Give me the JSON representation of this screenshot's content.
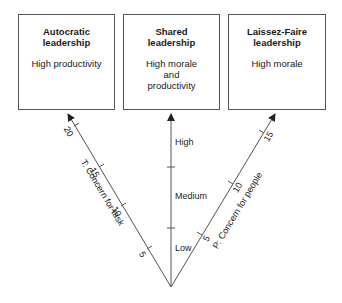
{
  "boxes": [
    {
      "title_line1": "Autocratic",
      "title_line2": "leadership",
      "desc_line1": "High productivity",
      "desc_line2": "",
      "desc_line3": ""
    },
    {
      "title_line1": "Shared",
      "title_line2": "leadership",
      "desc_line1": "High morale",
      "desc_line2": "and",
      "desc_line3": "productivity"
    },
    {
      "title_line1": "Laissez-Faire",
      "title_line2": "leadership",
      "desc_line1": "High morale",
      "desc_line2": "",
      "desc_line3": ""
    }
  ],
  "axes": {
    "task": {
      "label": "T: Concern for task",
      "ticks": [
        "5",
        "10",
        "15",
        "20"
      ]
    },
    "center": {
      "levels": [
        "High",
        "Medium",
        "Low"
      ]
    },
    "people": {
      "label": "P: Concern for people",
      "ticks": [
        "5",
        "10",
        "15"
      ]
    }
  },
  "colors": {
    "line": "#555555",
    "text": "#222222"
  }
}
